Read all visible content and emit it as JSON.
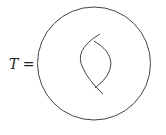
{
  "diagram": {
    "label_symbol": "T",
    "label_equals": "=",
    "stroke_color": "#333333"
  }
}
